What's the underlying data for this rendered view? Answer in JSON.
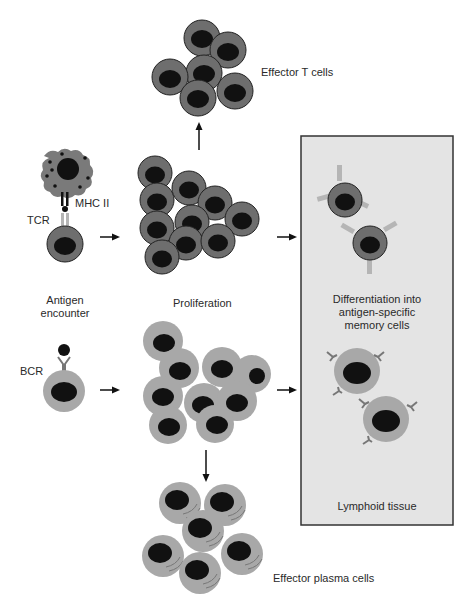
{
  "labels": {
    "effector_t": "Effector T cells",
    "mhc": "MHC II",
    "tcr": "TCR",
    "antigen_line1": "Antigen",
    "antigen_line2": "encounter",
    "proliferation": "Proliferation",
    "bcr": "BCR",
    "diff_line1": "Differentiation into",
    "diff_line2": "antigen-specific",
    "diff_line3": "memory cells",
    "lymphoid": "Lymphoid tissue",
    "effector_plasma": "Effector plasma cells"
  },
  "colors": {
    "t_cell_cytoplasm": "#6e6e6e",
    "b_cell_cytoplasm": "#a8a8a8",
    "nucleus": "#111111",
    "apc": "#7a7a7a",
    "box_fill": "#e4e4e4",
    "box_border": "#333333",
    "receptor": "#b5b5b5"
  }
}
